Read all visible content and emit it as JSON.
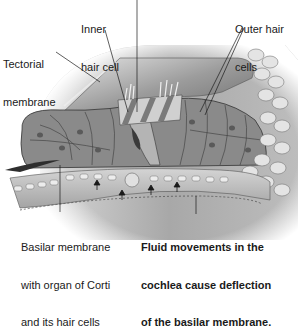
{
  "labels": {
    "inner_hair_cell": [
      "Inner",
      "hair cell"
    ],
    "outer_hair_cells": [
      "Outer hair",
      "cells"
    ],
    "tectorial_membrane": [
      "Tectorial",
      "membrane"
    ],
    "basilar_membrane": [
      "Basilar membrane",
      "with organ of Corti",
      "and its hair cells"
    ],
    "fluid_movements": [
      "Fluid movements in the",
      "cochlea cause deflection",
      "of the basilar membrane."
    ]
  },
  "colors": {
    "background": "#ffffff",
    "tissue_dark": "#6e6e6e",
    "tissue_mid": "#9a9a9a",
    "tissue_light": "#c8c8c8",
    "cell_outline": "#3c3c3c",
    "leader_line": "#1a1a1a",
    "text": "#1a1a1a"
  }
}
